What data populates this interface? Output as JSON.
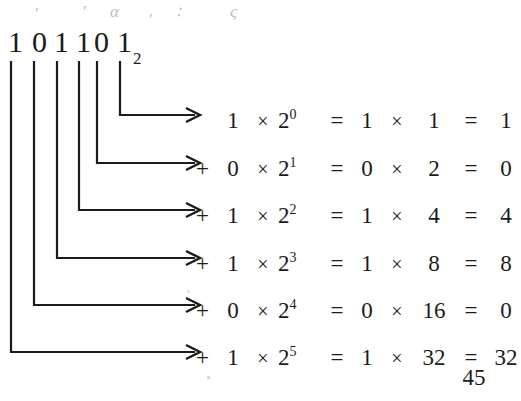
{
  "page": {
    "background": "#ffffff",
    "ink": "#1b1b1b",
    "pencil_color": "#b9bcc0"
  },
  "numeral": {
    "label": "binary-number",
    "digits": [
      "1",
      "0",
      "1",
      "1",
      "0",
      "1"
    ],
    "subscript": "2",
    "base_text": "101101",
    "positions_x": [
      8,
      32,
      54,
      76,
      94,
      117
    ]
  },
  "pencil_marks": [
    {
      "text": "′",
      "x": 34,
      "y": 4
    },
    {
      "text": "′",
      "x": 82,
      "y": 2
    },
    {
      "text": "α",
      "x": 110,
      "y": 2
    },
    {
      "text": "′",
      "x": 148,
      "y": 10
    },
    {
      "text": "∶",
      "x": 176,
      "y": 2
    },
    {
      "text": "ς",
      "x": 230,
      "y": 2
    }
  ],
  "connectors": {
    "description": "elbow leaders from each binary digit to its equation row",
    "leaders": [
      {
        "digit_index": 5,
        "from_x": 120,
        "row_y": 115,
        "arrow_x": 200
      },
      {
        "digit_index": 4,
        "from_x": 97,
        "row_y": 163,
        "arrow_x": 200
      },
      {
        "digit_index": 3,
        "from_x": 79,
        "row_y": 210,
        "arrow_x": 200
      },
      {
        "digit_index": 2,
        "from_x": 57,
        "row_y": 258,
        "arrow_x": 200
      },
      {
        "digit_index": 1,
        "from_x": 34,
        "row_y": 305,
        "arrow_x": 200
      },
      {
        "digit_index": 0,
        "from_x": 11,
        "row_y": 352,
        "arrow_x": 200
      }
    ],
    "line_top_y": 62
  },
  "equations": {
    "rows": [
      {
        "plus": "",
        "bit": "1",
        "times": "×",
        "power_base": "2",
        "power_exp": "0",
        "eq": "=",
        "bit2": "1",
        "times2": "×",
        "value": "1",
        "eq2": "=",
        "result": "1",
        "underlined": false,
        "y": 4
      },
      {
        "plus": "+",
        "bit": "0",
        "times": "×",
        "power_base": "2",
        "power_exp": "1",
        "eq": "=",
        "bit2": "0",
        "times2": "×",
        "value": "2",
        "eq2": "=",
        "result": "0",
        "underlined": false,
        "y": 52
      },
      {
        "plus": "+",
        "bit": "1",
        "times": "×",
        "power_base": "2",
        "power_exp": "2",
        "eq": "=",
        "bit2": "1",
        "times2": "×",
        "value": "4",
        "eq2": "=",
        "result": "4",
        "underlined": false,
        "y": 99
      },
      {
        "plus": "+",
        "bit": "1",
        "times": "×",
        "power_base": "2",
        "power_exp": "3",
        "eq": "=",
        "bit2": "1",
        "times2": "×",
        "value": "8",
        "eq2": "=",
        "result": "8",
        "underlined": false,
        "y": 147
      },
      {
        "plus": "+",
        "bit": "0",
        "times": "×",
        "power_base": "2",
        "power_exp": "4",
        "eq": "=",
        "bit2": "0",
        "times2": "×",
        "value": "16",
        "eq2": "=",
        "result": "0",
        "underlined": false,
        "y": 194
      },
      {
        "plus": "+",
        "bit": "1",
        "times": "×",
        "power_base": "2",
        "power_exp": "5",
        "eq": "=",
        "bit2": "1",
        "times2": "×",
        "value": "32",
        "eq2": "=",
        "result": "32",
        "underlined": true,
        "y": 241
      }
    ]
  },
  "total": {
    "label": "decimal-total",
    "value": "45"
  }
}
